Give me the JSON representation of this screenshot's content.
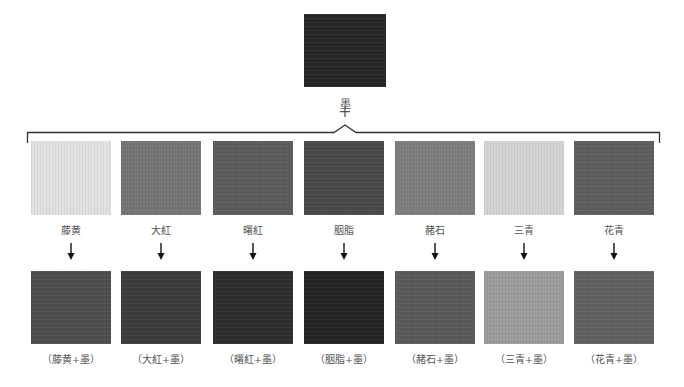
{
  "top": {
    "label": "墨",
    "plus": "+",
    "color": "#262626"
  },
  "pigments": [
    {
      "name": "藤黄",
      "color": "#e2e2e2",
      "mix_label": "（藤黄+墨）",
      "mix_color": "#4e4e4e"
    },
    {
      "name": "大紅",
      "color": "#757575",
      "mix_label": "（大紅+墨）",
      "mix_color": "#3c3c3c"
    },
    {
      "name": "曙紅",
      "color": "#5c5c5c",
      "mix_label": "（曙紅+墨）",
      "mix_color": "#2e2e2e"
    },
    {
      "name": "胭脂",
      "color": "#4a4a4a",
      "mix_label": "（胭脂+墨）",
      "mix_color": "#242424"
    },
    {
      "name": "赭石",
      "color": "#7e7e7e",
      "mix_label": "（赭石+墨）",
      "mix_color": "#5a5a5a"
    },
    {
      "name": "三青",
      "color": "#d4d4d4",
      "mix_label": "（三青+墨）",
      "mix_color": "#9c9c9c"
    },
    {
      "name": "花青",
      "color": "#5e5e5e",
      "mix_label": "（花青+墨）",
      "mix_color": "#616161"
    }
  ]
}
